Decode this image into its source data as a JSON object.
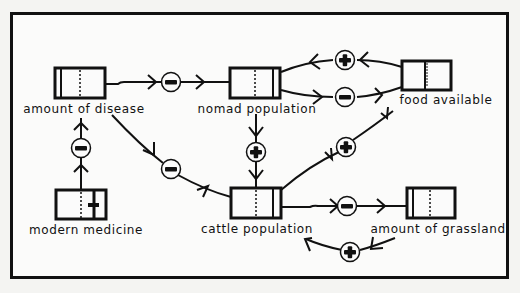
{
  "diagram": {
    "type": "causal-loop",
    "background": "#f4f4f2",
    "stroke_color": "#111111",
    "nodes": [
      {
        "id": "disease",
        "label": "amount of disease"
      },
      {
        "id": "nomad",
        "label": "nomad population"
      },
      {
        "id": "food",
        "label": "food available"
      },
      {
        "id": "medicine",
        "label": "modern medicine"
      },
      {
        "id": "cattle",
        "label": "cattle population"
      },
      {
        "id": "grassland",
        "label": "amount of grassland"
      }
    ],
    "edges": [
      {
        "from": "disease",
        "to": "nomad",
        "sign": "-"
      },
      {
        "from": "food",
        "to": "nomad",
        "sign": "+"
      },
      {
        "from": "nomad",
        "to": "food",
        "sign": "-"
      },
      {
        "from": "nomad",
        "to": "cattle",
        "sign": "+"
      },
      {
        "from": "disease",
        "to": "cattle",
        "sign": "-"
      },
      {
        "from": "medicine",
        "to": "disease",
        "sign": "-"
      },
      {
        "from": "cattle",
        "to": "food",
        "sign": "+"
      },
      {
        "from": "cattle",
        "to": "grassland",
        "sign": "-"
      },
      {
        "from": "grassland",
        "to": "cattle",
        "sign": "+"
      }
    ]
  }
}
